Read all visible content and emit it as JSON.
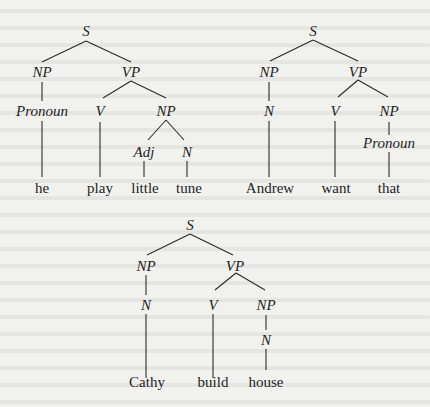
{
  "trees": [
    {
      "name": "tree-he-play-little-tune",
      "nodes": {
        "s": {
          "label": "S",
          "x": 86,
          "y": 34
        },
        "np": {
          "label": "NP",
          "x": 42,
          "y": 75
        },
        "vp": {
          "label": "VP",
          "x": 131,
          "y": 75
        },
        "pronoun": {
          "label": "Pronoun",
          "x": 42,
          "y": 115
        },
        "v": {
          "label": "V",
          "x": 100,
          "y": 115
        },
        "np2": {
          "label": "NP",
          "x": 166,
          "y": 115
        },
        "adj": {
          "label": "Adj",
          "x": 144,
          "y": 155
        },
        "n": {
          "label": "N",
          "x": 187,
          "y": 155
        }
      },
      "words": [
        "he",
        "play",
        "little",
        "tune"
      ]
    },
    {
      "name": "tree-andrew-want-that",
      "nodes": {
        "s": {
          "label": "S",
          "x": 313,
          "y": 34
        },
        "np": {
          "label": "NP",
          "x": 269,
          "y": 75
        },
        "vp": {
          "label": "VP",
          "x": 358,
          "y": 75
        },
        "n": {
          "label": "N",
          "x": 269,
          "y": 115
        },
        "v": {
          "label": "V",
          "x": 335,
          "y": 115
        },
        "np2": {
          "label": "NP",
          "x": 389,
          "y": 115
        },
        "pronoun": {
          "label": "Pronoun",
          "x": 389,
          "y": 146
        }
      },
      "words": [
        "Andrew",
        "want",
        "that"
      ]
    },
    {
      "name": "tree-cathy-build-house",
      "nodes": {
        "s": {
          "label": "S",
          "x": 190,
          "y": 228
        },
        "np": {
          "label": "NP",
          "x": 146,
          "y": 268
        },
        "vp": {
          "label": "VP",
          "x": 235,
          "y": 268
        },
        "n": {
          "label": "N",
          "x": 146,
          "y": 308
        },
        "v": {
          "label": "V",
          "x": 213,
          "y": 308
        },
        "np2": {
          "label": "NP",
          "x": 266,
          "y": 308
        },
        "n2": {
          "label": "N",
          "x": 266,
          "y": 342
        }
      },
      "words": [
        "Cathy",
        "build",
        "house"
      ]
    }
  ]
}
